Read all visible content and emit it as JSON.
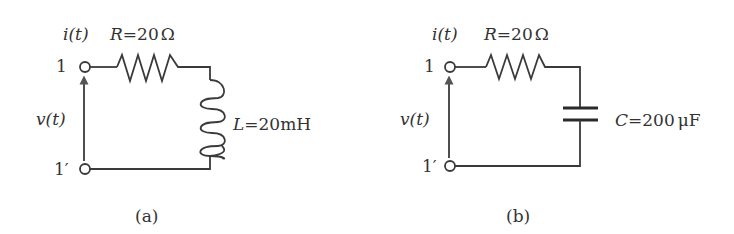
{
  "figure": {
    "circuits": [
      {
        "id": "a",
        "caption": "(a)",
        "terminal_top": "1",
        "terminal_bottom": "1′",
        "current_label": "i(t)",
        "voltage_label": "v(t)",
        "resistor": {
          "symbol": "R",
          "value": "20",
          "unit": "Ω",
          "text": "R=20Ω"
        },
        "second_element": {
          "type": "inductor",
          "symbol": "L",
          "value": "20",
          "unit": "mH",
          "text": "L=20mH"
        }
      },
      {
        "id": "b",
        "caption": "(b)",
        "terminal_top": "1",
        "terminal_bottom": "1′",
        "current_label": "i(t)",
        "voltage_label": "v(t)",
        "resistor": {
          "symbol": "R",
          "value": "20",
          "unit": "Ω",
          "text": "R=20Ω"
        },
        "second_element": {
          "type": "capacitor",
          "symbol": "C",
          "value": "200",
          "unit": "μF",
          "text": "C=200μF"
        }
      }
    ]
  },
  "colors": {
    "line": "#3a3a3a",
    "text": "#333333",
    "arrow": "#555555"
  }
}
